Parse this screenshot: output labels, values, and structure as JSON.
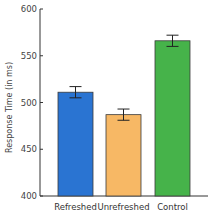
{
  "chart_data": {
    "type": "bar",
    "title": "",
    "xlabel": "",
    "ylabel": "Response Time (in ms)",
    "ylim": [
      400,
      600
    ],
    "yticks": [
      400,
      450,
      500,
      550,
      600
    ],
    "grid": false,
    "categories": [
      "Refreshed",
      "Unrefreshed",
      "Control"
    ],
    "values": [
      511,
      487,
      566
    ],
    "error": [
      6,
      6,
      6
    ],
    "colors": [
      "#2a74d2",
      "#f7b865",
      "#46b34a"
    ]
  }
}
